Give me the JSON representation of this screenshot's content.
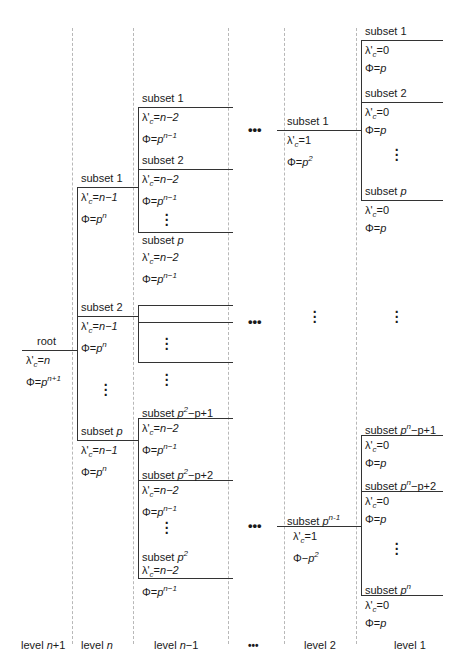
{
  "levels": {
    "l_np1": {
      "prefix": "level ",
      "var": "n",
      "suffix": "+1"
    },
    "l_n": {
      "prefix": "level ",
      "var": "n",
      "suffix": ""
    },
    "l_nm1": {
      "prefix": "level ",
      "var": "n",
      "suffix": "−1"
    },
    "l_dots": "•••",
    "l_2": "level 2",
    "l_1": "level 1"
  },
  "common": {
    "lambda": "λ'",
    "c": "c",
    "phi": "Φ=",
    "p": "p",
    "n": "n",
    "subset": "subset ",
    "eq": "="
  },
  "root": {
    "label": "root",
    "lambda_val": "n",
    "phi_exp": "n+1"
  },
  "level_n": {
    "nodes": [
      {
        "label": "subset 1",
        "lambda_val": "n−1",
        "phi_exp": "n"
      },
      {
        "label": "subset 2",
        "lambda_val": "n−1",
        "phi_exp": "n"
      },
      {
        "label_prefix": "subset ",
        "label_var": "p",
        "lambda_val": "n−1",
        "phi_exp": "n"
      }
    ]
  },
  "level_nm1": {
    "nodes": [
      {
        "label": "subset 1",
        "lambda_val": "n−2",
        "phi_exp": "n−1"
      },
      {
        "label": "subset 2",
        "lambda_val": "n−2",
        "phi_exp": "n−1"
      },
      {
        "label_prefix": "subset ",
        "label_var": "p",
        "lambda_val": "n−2",
        "phi_exp": "n−1"
      },
      {
        "label_prefix": "subset ",
        "label_var": "p",
        "label_sup": "2",
        "label_suffix": "−p+1",
        "lambda_val": "n−2",
        "phi_exp": "n−1"
      },
      {
        "label_prefix": "subset ",
        "label_var": "p",
        "label_sup": "2",
        "label_suffix": "−p+2",
        "lambda_val": "n−2",
        "phi_exp": "n−1"
      },
      {
        "label_prefix": "subset ",
        "label_var": "p",
        "label_sup": "2",
        "lambda_val": "n−2",
        "phi_exp": "n−1"
      }
    ]
  },
  "level_2": {
    "nodes": [
      {
        "label": "subset 1",
        "lambda_val": "1",
        "phi_exp": "2"
      },
      {
        "label_prefix": "subset ",
        "label_var": "p",
        "label_sup": "n-1",
        "lambda_val": "1",
        "phi_prefix": "Φ−",
        "phi_exp": "2"
      }
    ]
  },
  "level_1": {
    "nodes": [
      {
        "label": "subset 1",
        "lambda_val": "0"
      },
      {
        "label": "subset 2",
        "lambda_val": "0"
      },
      {
        "label_prefix": "subset ",
        "label_var": "p",
        "lambda_val": "0"
      },
      {
        "label_prefix": "subset ",
        "label_var": "p",
        "label_sup": "n",
        "label_suffix": "−p+1",
        "lambda_val": "0"
      },
      {
        "label_prefix": "subset ",
        "label_var": "p",
        "label_sup": "n",
        "label_suffix": "−p+2",
        "lambda_val": "0"
      },
      {
        "label_prefix": "subset ",
        "label_var": "p",
        "label_sup": "n",
        "lambda_val": "0"
      }
    ]
  },
  "ellipsis": {
    "vertical": "⋮",
    "horizontal": "•••"
  }
}
